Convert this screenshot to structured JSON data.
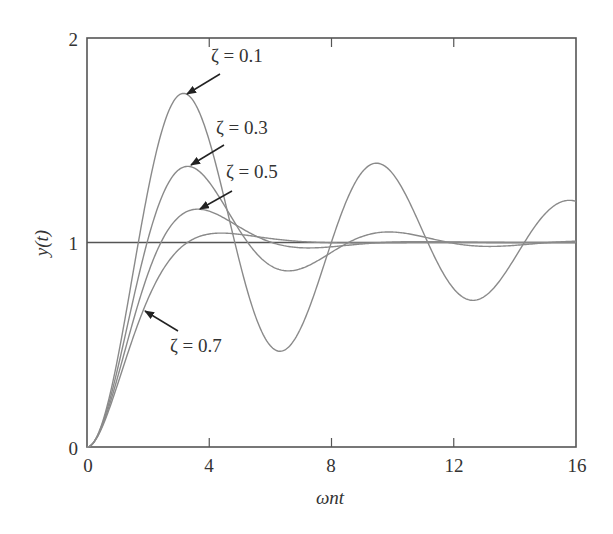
{
  "chart_data": {
    "type": "line",
    "title": "",
    "xlabel": "ωnt",
    "ylabel": "y(t)",
    "xlim": [
      0,
      16
    ],
    "ylim": [
      0,
      2
    ],
    "xticks": [
      0,
      4,
      8,
      12,
      16
    ],
    "yticks": [
      0,
      1,
      2
    ],
    "grid": false,
    "legend": "none (inline arrow annotations)",
    "reference_line": {
      "y": 1,
      "label": "steady-state value"
    },
    "x": [
      0,
      0.5,
      1,
      1.5,
      2,
      2.5,
      3,
      3.5,
      4,
      4.5,
      5,
      5.5,
      6,
      6.5,
      7,
      7.5,
      8,
      8.5,
      9,
      9.5,
      10,
      10.5,
      11,
      11.5,
      12,
      12.5,
      13,
      13.5,
      14,
      14.5,
      15,
      15.5,
      16
    ],
    "series": [
      {
        "name": "ζ = 0.1",
        "zeta": 0.1,
        "values": [
          0,
          0.12,
          0.44,
          0.87,
          1.31,
          1.62,
          1.73,
          1.67,
          1.48,
          1.2,
          0.93,
          0.68,
          0.52,
          0.48,
          0.56,
          0.75,
          0.98,
          1.19,
          1.34,
          1.39,
          1.35,
          1.22,
          1.05,
          0.89,
          0.78,
          0.73,
          0.76,
          0.86,
          0.99,
          1.12,
          1.21,
          1.25,
          1.22
        ]
      },
      {
        "name": "ζ = 0.3",
        "zeta": 0.3,
        "values": [
          0,
          0.11,
          0.4,
          0.75,
          1.06,
          1.27,
          1.37,
          1.35,
          1.26,
          1.13,
          1.0,
          0.92,
          0.88,
          0.88,
          0.91,
          0.96,
          1.0,
          1.04,
          1.05,
          1.05,
          1.04,
          1.02,
          1.0,
          0.99,
          0.98,
          0.98,
          0.99,
          0.99,
          1.0,
          1.0,
          1.01,
          1.01,
          1.0
        ]
      },
      {
        "name": "ζ = 0.5",
        "zeta": 0.5,
        "values": [
          0,
          0.11,
          0.37,
          0.68,
          0.94,
          1.1,
          1.16,
          1.15,
          1.11,
          1.06,
          1.02,
          0.99,
          0.98,
          0.98,
          0.99,
          1.0,
          1.0,
          1.0,
          1.0,
          1.0,
          1.0,
          1.0,
          1.0,
          1.0,
          1.0,
          1.0,
          1.0,
          1.0,
          1.0,
          1.0,
          1.0,
          1.0,
          1.0
        ]
      },
      {
        "name": "ζ = 0.7",
        "zeta": 0.7,
        "values": [
          0,
          0.1,
          0.33,
          0.59,
          0.8,
          0.94,
          1.01,
          1.04,
          1.04,
          1.04,
          1.03,
          1.02,
          1.01,
          1.0,
          1.0,
          1.0,
          1.0,
          1.0,
          1.0,
          1.0,
          1.0,
          1.0,
          1.0,
          1.0,
          1.0,
          1.0,
          1.0,
          1.0,
          1.0,
          1.0,
          1.0,
          1.0,
          1.0
        ]
      }
    ],
    "annotations": [
      {
        "text": "ζ = 0.1",
        "points_to": {
          "x": 3.1,
          "y": 1.73
        }
      },
      {
        "text": "ζ = 0.3",
        "points_to": {
          "x": 3.4,
          "y": 1.37
        }
      },
      {
        "text": "ζ = 0.5",
        "points_to": {
          "x": 3.6,
          "y": 1.16
        }
      },
      {
        "text": "ζ = 0.7",
        "points_to": {
          "x": 1.8,
          "y": 0.7
        }
      }
    ]
  },
  "colors": {
    "curve": "#8a8a8a",
    "axis": "#555555",
    "reference": "#555555",
    "text": "#333333",
    "background": "#ffffff"
  },
  "labels": {
    "xlabel": "ωnt",
    "ylabel": "y(t)",
    "ann_01": "ζ = 0.1",
    "ann_03": "ζ = 0.3",
    "ann_05": "ζ = 0.5",
    "ann_07": "ζ = 0.7",
    "xt": [
      "0",
      "4",
      "8",
      "12",
      "16"
    ],
    "yt": [
      "0",
      "1",
      "2"
    ]
  }
}
